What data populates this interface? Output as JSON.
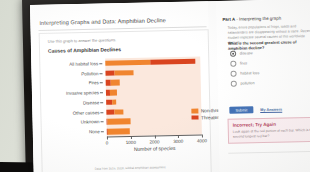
{
  "lesson": {
    "title": "Interpreting Graphs and Data: Amphibian Decline",
    "instruction": "Use this graph to answer the questions.",
    "source_note": "Data from 2016, 2018, Global amphibian assessment"
  },
  "chart_data": {
    "type": "bar",
    "orientation": "horizontal",
    "stacked": true,
    "title": "Causes of Amphibian Declines",
    "xlabel": "Number of species",
    "ylabel": "",
    "xlim": [
      0,
      4000
    ],
    "xticks": [
      0,
      1000,
      2000,
      3000,
      4000
    ],
    "xtick_labels": [
      "0",
      "1000",
      "2000",
      "3000",
      "4000"
    ],
    "grid": false,
    "legend_position": "inside-center-right",
    "categories": [
      "All habitat loss",
      "Pollution",
      "Fires",
      "Invasive species",
      "Disease",
      "Other causes",
      "Unknown",
      "None"
    ],
    "series": [
      {
        "name": "Threatened species",
        "color": "#d9441f",
        "values": [
          1900,
          380,
          230,
          175,
          240,
          320,
          60,
          55
        ]
      },
      {
        "name": "Non-threatened species",
        "color": "#f0852f",
        "values": [
          1900,
          780,
          370,
          300,
          190,
          380,
          970,
          920
        ]
      }
    ],
    "totals": [
      3800,
      1160,
      600,
      475,
      430,
      700,
      1030,
      975
    ]
  },
  "question_panel": {
    "part_label": "Part A",
    "part_title": "- Interpreting the graph",
    "paragraph": "Today, entire populations of frogs, toads and salamanders are disappearing without a trace. Recent studies implicate several causes of this worldwide decline.",
    "question": "What is the second greatest cause of amphibian decline?",
    "options": [
      {
        "label": "disease",
        "selected": true
      },
      {
        "label": "fires",
        "selected": false
      },
      {
        "label": "habitat loss",
        "selected": false
      },
      {
        "label": "pollution",
        "selected": false
      }
    ],
    "submit_label": "Submit",
    "my_answers_label": "My Answers",
    "feedback": {
      "title": "Incorrect; Try Again",
      "body": "Look again at the red portion of each bar. Which is the second longest red bar?"
    }
  }
}
